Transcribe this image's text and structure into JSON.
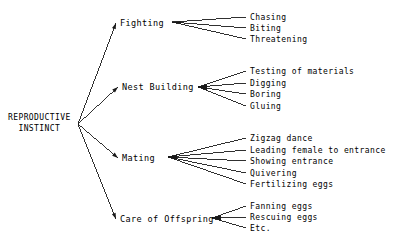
{
  "diagram": {
    "title_text": "REPRODUCTIVE INSTINCT",
    "type": "hierarchical-fan-tree",
    "line_color": "#1a1a1a",
    "background_color": "#ffffff",
    "text_color": "#000000",
    "root": {
      "line1": "REPRODUCTIVE",
      "line2": "INSTINCT"
    },
    "branches": [
      {
        "label": "Fighting",
        "leaves": [
          "Chasing",
          "Biting",
          "Threatening"
        ]
      },
      {
        "label": "Nest Building",
        "leaves": [
          "Testing of materials",
          "Digging",
          "Boring",
          "Gluing"
        ]
      },
      {
        "label": "Mating",
        "leaves": [
          "Zigzag dance",
          "Leading female to entrance",
          "Showing entrance",
          "Quivering",
          "Fertilizing eggs"
        ]
      },
      {
        "label": "Care of Offspring",
        "leaves": [
          "Fanning eggs",
          "Rescuing eggs",
          "Etc."
        ]
      }
    ]
  },
  "geometry": {
    "root_fan_origin": {
      "x": 78,
      "y": 124
    },
    "root_label_pos": {
      "x": 8,
      "y": 113
    },
    "branch_nodes": [
      {
        "label_x": 120,
        "label_y": 18,
        "fan_x": 172,
        "fan_y": 22,
        "leaf_x": 250,
        "leaf_ys": [
          13,
          24,
          35
        ]
      },
      {
        "label_x": 122,
        "label_y": 82,
        "fan_x": 198,
        "fan_y": 87,
        "leaf_x": 250,
        "leaf_ys": [
          67,
          79,
          90,
          102
        ]
      },
      {
        "label_x": 122,
        "label_y": 153,
        "fan_x": 168,
        "fan_y": 157,
        "leaf_x": 250,
        "leaf_ys": [
          134,
          146,
          157,
          169,
          180
        ]
      },
      {
        "label_x": 120,
        "label_y": 214,
        "fan_x": 212,
        "fan_y": 218,
        "leaf_x": 250,
        "leaf_ys": [
          202,
          213,
          224
        ]
      }
    ]
  }
}
